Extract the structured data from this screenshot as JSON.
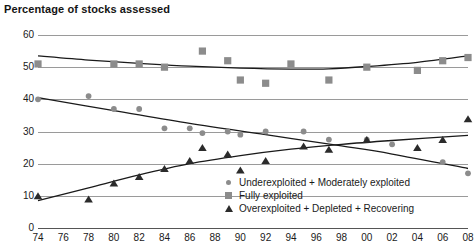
{
  "chart_data": {
    "type": "scatter",
    "title": "Percentage of stocks assessed",
    "xlabel": "",
    "ylabel": "",
    "xlim": [
      1974,
      2008
    ],
    "ylim": [
      0,
      60
    ],
    "grid": true,
    "legend_position": "bottom-right",
    "x_tick_labels": [
      "74",
      "76",
      "78",
      "80",
      "82",
      "84",
      "86",
      "88",
      "90",
      "92",
      "94",
      "96",
      "98",
      "00",
      "02",
      "04",
      "06",
      "08"
    ],
    "x_tick_values": [
      1974,
      1976,
      1978,
      1980,
      1982,
      1984,
      1986,
      1988,
      1990,
      1992,
      1994,
      1996,
      1998,
      2000,
      2002,
      2004,
      2006,
      2008
    ],
    "y_tick_labels": [
      "0",
      "10",
      "20",
      "30",
      "40",
      "50",
      "60"
    ],
    "y_tick_values": [
      0,
      10,
      20,
      30,
      40,
      50,
      60
    ],
    "series": [
      {
        "name": "Underexploited + Moderately exploited",
        "marker": "circle",
        "color": "#8c8c8c",
        "trend_color": "#1a1a1a",
        "x": [
          1974,
          1978,
          1980,
          1982,
          1984,
          1986,
          1987,
          1989,
          1990,
          1992,
          1995,
          1997,
          2000,
          2002,
          2006,
          2008
        ],
        "values": [
          40,
          41,
          37,
          37,
          31,
          31,
          29.5,
          30,
          29,
          30,
          30,
          27.5,
          27.5,
          26,
          20.5,
          17
        ]
      },
      {
        "name": "Fully exploited",
        "marker": "square",
        "color": "#8c8c8c",
        "trend_color": "#1a1a1a",
        "x": [
          1974,
          1980,
          1982,
          1984,
          1987,
          1989,
          1990,
          1992,
          1994,
          1997,
          2000,
          2004,
          2006,
          2008
        ],
        "values": [
          51,
          51,
          51,
          50,
          55,
          52,
          46,
          45,
          51,
          46,
          50,
          49,
          52,
          53
        ]
      },
      {
        "name": "Overexploited + Depleted + Recovering",
        "marker": "triangle",
        "color": "#2b2b2b",
        "trend_color": "#1a1a1a",
        "x": [
          1974,
          1978,
          1980,
          1982,
          1984,
          1986,
          1987,
          1989,
          1990,
          1992,
          1995,
          1997,
          2000,
          2004,
          2006,
          2008
        ],
        "values": [
          10,
          9,
          14,
          16,
          18.5,
          21,
          25,
          23,
          18,
          21,
          25.5,
          24.5,
          27.5,
          25,
          27.5,
          34
        ]
      }
    ],
    "trend_lines": [
      {
        "name": "Underexploited + Moderately exploited",
        "points": [
          [
            1974,
            40.5
          ],
          [
            1980,
            36.5
          ],
          [
            1986,
            32.5
          ],
          [
            1992,
            29
          ],
          [
            1998,
            25.5
          ],
          [
            2002,
            23
          ],
          [
            2008,
            18.5
          ]
        ]
      },
      {
        "name": "Fully exploited",
        "points": [
          [
            1974,
            53.5
          ],
          [
            1978,
            52.2
          ],
          [
            1982,
            51.2
          ],
          [
            1986,
            50.3
          ],
          [
            1990,
            49.7
          ],
          [
            1994,
            49.4
          ],
          [
            1997,
            49.5
          ],
          [
            2000,
            50.2
          ],
          [
            2004,
            51.5
          ],
          [
            2008,
            53.5
          ]
        ]
      },
      {
        "name": "Overexploited + Depleted + Recovering",
        "points": [
          [
            1974,
            8.5
          ],
          [
            1978,
            12.5
          ],
          [
            1982,
            16.5
          ],
          [
            1986,
            20
          ],
          [
            1990,
            22.5
          ],
          [
            1994,
            24.5
          ],
          [
            1998,
            26
          ],
          [
            2002,
            27.2
          ],
          [
            2008,
            28.8
          ]
        ]
      }
    ]
  }
}
